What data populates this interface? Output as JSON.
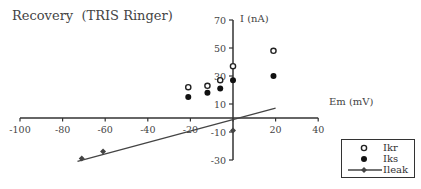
{
  "chart_data": {
    "type": "scatter",
    "title": "Recovery  (TRIS Ringer)",
    "xlabel": "Em (mV)",
    "ylabel": "I (nA)",
    "xlim": [
      -100,
      40
    ],
    "ylim": [
      -30,
      70
    ],
    "x_ticks": [
      -100,
      -80,
      -60,
      -40,
      -20,
      0,
      20,
      40
    ],
    "x_tick_labels": [
      "-100",
      "-80",
      "-60",
      "-40",
      "-20",
      "",
      "20",
      "40"
    ],
    "y_ticks": [
      70,
      50,
      30,
      10,
      -10,
      -30
    ],
    "y_tick_labels": [
      "70",
      "50",
      "30",
      "10",
      "-10",
      "-30"
    ],
    "grid": false,
    "legend_position": "lower right",
    "series": [
      {
        "name": "Ikr",
        "marker": "open-circle",
        "x": [
          -21,
          -12,
          -6,
          0,
          19
        ],
        "y": [
          22,
          23,
          27,
          37,
          48
        ]
      },
      {
        "name": "Iks",
        "marker": "filled-circle",
        "x": [
          -21,
          -12,
          -6,
          0,
          19
        ],
        "y": [
          15,
          18,
          21,
          27,
          30
        ]
      },
      {
        "name": "Ileak",
        "marker": "line-with-diamond",
        "x": [
          -71,
          -61,
          0
        ],
        "y": [
          -29,
          -24,
          -9
        ],
        "fit_line": {
          "x": [
            -73,
            20
          ],
          "y": [
            -31,
            7
          ]
        }
      }
    ]
  },
  "legend": {
    "items": [
      {
        "label": "Ikr"
      },
      {
        "label": "Iks"
      },
      {
        "label": "Ileak"
      }
    ]
  }
}
